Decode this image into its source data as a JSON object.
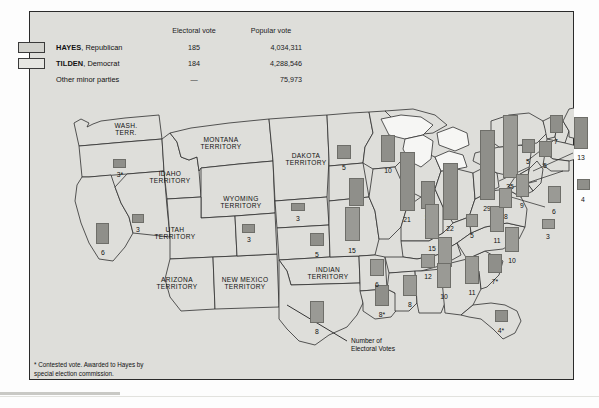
{
  "legend": {
    "col_electoral": "Electoral vote",
    "col_popular": "Popular vote",
    "rows": [
      {
        "candidate_bold": "HAYES",
        "candidate_rest": ", Republican",
        "electoral": "185",
        "popular": "4,034,311",
        "swatch": "hayes"
      },
      {
        "candidate_bold": "TILDEN",
        "candidate_rest": ", Democrat",
        "electoral": "184",
        "popular": "4,288,546",
        "swatch": "tilden"
      },
      {
        "candidate_bold": "",
        "candidate_rest": "Other minor parties",
        "electoral": "—",
        "popular": "75,973",
        "swatch": "none"
      }
    ]
  },
  "callout": {
    "line1": "Number of",
    "line2": "Electoral Votes"
  },
  "footnote": "* Contested vote. Awarded to Hayes by\n   special election commission.",
  "territories": [
    {
      "name": "WASH.\nTERR.",
      "x": 97,
      "y": 118
    },
    {
      "name": "MONTANA\nTERRITORY",
      "x": 192,
      "y": 132
    },
    {
      "name": "IDAHO\nTERRITORY",
      "x": 141,
      "y": 166
    },
    {
      "name": "WYOMING\nTERRITORY",
      "x": 212,
      "y": 191
    },
    {
      "name": "DAKOTA\nTERRITORY",
      "x": 277,
      "y": 148
    },
    {
      "name": "UTAH\nTERRITORY",
      "x": 146,
      "y": 222
    },
    {
      "name": "ARIZONA\nTERRITORY",
      "x": 148,
      "y": 272
    },
    {
      "name": "NEW MEXICO\nTERRITORY",
      "x": 216,
      "y": 272
    },
    {
      "name": "INDIAN\nTERRITORY",
      "x": 299,
      "y": 262
    }
  ],
  "states": [
    {
      "name": "Oregon",
      "votes": "3*",
      "party": "hayes",
      "bar": {
        "x": 84,
        "y": 148,
        "w": 13,
        "h": 9
      },
      "label": {
        "x": 91,
        "y": 160
      }
    },
    {
      "name": "California",
      "votes": "6",
      "party": "hayes",
      "bar": {
        "x": 67,
        "y": 212,
        "w": 13,
        "h": 21
      },
      "label": {
        "x": 74,
        "y": 238
      }
    },
    {
      "name": "Nevada",
      "votes": "3",
      "party": "hayes",
      "bar": {
        "x": 103,
        "y": 203,
        "w": 12,
        "h": 9
      },
      "label": {
        "x": 109,
        "y": 215
      }
    },
    {
      "name": "Colorado",
      "votes": "3",
      "party": "hayes",
      "bar": {
        "x": 213,
        "y": 213,
        "w": 13,
        "h": 9
      },
      "label": {
        "x": 220,
        "y": 225
      }
    },
    {
      "name": "Nebraska",
      "votes": "3",
      "party": "hayes",
      "bar": {
        "x": 262,
        "y": 192,
        "w": 14,
        "h": 8
      },
      "label": {
        "x": 269,
        "y": 204
      }
    },
    {
      "name": "Kansas",
      "votes": "5",
      "party": "hayes",
      "bar": {
        "x": 281,
        "y": 222,
        "w": 14,
        "h": 13
      },
      "label": {
        "x": 288,
        "y": 240
      }
    },
    {
      "name": "Minnesota",
      "votes": "5",
      "party": "hayes",
      "bar": {
        "x": 308,
        "y": 134,
        "w": 14,
        "h": 14
      },
      "label": {
        "x": 315,
        "y": 153
      }
    },
    {
      "name": "Iowa",
      "votes": "11",
      "party": "hayes",
      "bar": {
        "x": 320,
        "y": 167,
        "w": 15,
        "h": 28
      },
      "label": {
        "x": 327,
        "y": 200
      }
    },
    {
      "name": "Missouri",
      "votes": "15",
      "party": "tilden",
      "bar": {
        "x": 316,
        "y": 196,
        "w": 15,
        "h": 34
      },
      "label": {
        "x": 323,
        "y": 236
      }
    },
    {
      "name": "Wisconsin",
      "votes": "10",
      "party": "hayes",
      "bar": {
        "x": 352,
        "y": 124,
        "w": 14,
        "h": 27
      },
      "label": {
        "x": 359,
        "y": 156
      }
    },
    {
      "name": "Illinois",
      "votes": "21",
      "party": "hayes",
      "bar": {
        "x": 371,
        "y": 141,
        "w": 15,
        "h": 59
      },
      "label": {
        "x": 378,
        "y": 205
      }
    },
    {
      "name": "Michigan",
      "votes": "11",
      "party": "hayes",
      "bar": {
        "x": 392,
        "y": 170,
        "w": 14,
        "h": 28
      },
      "label": {
        "x": 399,
        "y": 203
      }
    },
    {
      "name": "Indiana",
      "votes": "15",
      "party": "tilden",
      "bar": {
        "x": 396,
        "y": 193,
        "w": 14,
        "h": 35
      },
      "label": {
        "x": 403,
        "y": 234
      }
    },
    {
      "name": "Ohio",
      "votes": "22",
      "party": "hayes",
      "bar": {
        "x": 414,
        "y": 152,
        "w": 15,
        "h": 57
      },
      "label": {
        "x": 421,
        "y": 214
      }
    },
    {
      "name": "Kentucky",
      "votes": "12",
      "party": "tilden",
      "bar": {
        "x": 409,
        "y": 226,
        "w": 14,
        "h": 30
      },
      "label": {
        "x": 416,
        "y": 261
      }
    },
    {
      "name": "Pennsylvania",
      "votes": "29",
      "party": "hayes",
      "bar": {
        "x": 451,
        "y": 119,
        "w": 15,
        "h": 70
      },
      "label": {
        "x": 458,
        "y": 194
      }
    },
    {
      "name": "West Virginia",
      "votes": "5",
      "party": "tilden",
      "bar": {
        "x": 437,
        "y": 203,
        "w": 12,
        "h": 13
      },
      "label": {
        "x": 443,
        "y": 221
      }
    },
    {
      "name": "Virginia",
      "votes": "11",
      "party": "tilden",
      "bar": {
        "x": 461,
        "y": 195,
        "w": 14,
        "h": 26
      },
      "label": {
        "x": 468,
        "y": 226
      }
    },
    {
      "name": "New York",
      "votes": "35",
      "party": "tilden",
      "bar": {
        "x": 474,
        "y": 104,
        "w": 15,
        "h": 63
      },
      "label": {
        "x": 481,
        "y": 172
      }
    },
    {
      "name": "Vermont",
      "votes": "5",
      "party": "hayes",
      "bar": {
        "x": 493,
        "y": 128,
        "w": 13,
        "h": 14
      },
      "label": {
        "x": 499,
        "y": 147
      }
    },
    {
      "name": "New Hampshire",
      "votes": "5",
      "party": "hayes",
      "bar": {
        "x": 510,
        "y": 130,
        "w": 13,
        "h": 16
      },
      "label": {
        "x": 516,
        "y": 151
      }
    },
    {
      "name": "Maine",
      "votes": "7",
      "party": "hayes",
      "bar": {
        "x": 521,
        "y": 104,
        "w": 13,
        "h": 18
      },
      "label": {
        "x": 527,
        "y": 127
      }
    },
    {
      "name": "Massachusetts",
      "votes": "13",
      "party": "hayes",
      "bar": {
        "x": 545,
        "y": 106,
        "w": 14,
        "h": 32
      },
      "label": {
        "x": 552,
        "y": 143
      }
    },
    {
      "name": "Rhode Island",
      "votes": "4",
      "party": "hayes",
      "bar": {
        "x": 548,
        "y": 168,
        "w": 13,
        "h": 11
      },
      "label": {
        "x": 554,
        "y": 185
      }
    },
    {
      "name": "Connecticut",
      "votes": "6",
      "party": "tilden",
      "bar": {
        "x": 519,
        "y": 175,
        "w": 13,
        "h": 17
      },
      "label": {
        "x": 525,
        "y": 197
      }
    },
    {
      "name": "New Jersey",
      "votes": "9",
      "party": "tilden",
      "bar": {
        "x": 487,
        "y": 163,
        "w": 13,
        "h": 23
      },
      "label": {
        "x": 493,
        "y": 191
      }
    },
    {
      "name": "Maryland",
      "votes": "8",
      "party": "tilden",
      "bar": {
        "x": 470,
        "y": 177,
        "w": 13,
        "h": 20
      },
      "label": {
        "x": 477,
        "y": 202
      }
    },
    {
      "name": "Delaware",
      "votes": "3",
      "party": "tilden",
      "bar": {
        "x": 513,
        "y": 208,
        "w": 13,
        "h": 10
      },
      "label": {
        "x": 519,
        "y": 222
      }
    },
    {
      "name": "North Carolina",
      "votes": "10",
      "party": "tilden",
      "bar": {
        "x": 476,
        "y": 216,
        "w": 14,
        "h": 25
      },
      "label": {
        "x": 483,
        "y": 246
      }
    },
    {
      "name": "South Carolina",
      "votes": "7*",
      "party": "hayes",
      "bar": {
        "x": 459,
        "y": 243,
        "w": 14,
        "h": 19
      },
      "label": {
        "x": 466,
        "y": 267
      }
    },
    {
      "name": "Georgia",
      "votes": "11",
      "party": "tilden",
      "bar": {
        "x": 436,
        "y": 245,
        "w": 14,
        "h": 28
      },
      "label": {
        "x": 443,
        "y": 278
      }
    },
    {
      "name": "Florida",
      "votes": "4*",
      "party": "hayes",
      "bar": {
        "x": 466,
        "y": 299,
        "w": 13,
        "h": 12
      },
      "label": {
        "x": 472,
        "y": 316
      }
    },
    {
      "name": "Alabama",
      "votes": "10",
      "party": "tilden",
      "bar": {
        "x": 408,
        "y": 252,
        "w": 14,
        "h": 25
      },
      "label": {
        "x": 415,
        "y": 282
      }
    },
    {
      "name": "Tennessee",
      "votes": "12",
      "party": "tilden",
      "bar": {
        "x": 392,
        "y": 243,
        "w": 14,
        "h": 14
      },
      "label": {
        "x": 399,
        "y": 262
      }
    },
    {
      "name": "Mississippi",
      "votes": "8",
      "party": "tilden",
      "bar": {
        "x": 374,
        "y": 264,
        "w": 14,
        "h": 21
      },
      "label": {
        "x": 381,
        "y": 290
      }
    },
    {
      "name": "Louisiana",
      "votes": "8*",
      "party": "hayes",
      "bar": {
        "x": 346,
        "y": 274,
        "w": 14,
        "h": 21
      },
      "label": {
        "x": 353,
        "y": 300
      }
    },
    {
      "name": "Arkansas",
      "votes": "6",
      "party": "tilden",
      "bar": {
        "x": 341,
        "y": 248,
        "w": 14,
        "h": 17
      },
      "label": {
        "x": 348,
        "y": 270
      }
    },
    {
      "name": "Texas",
      "votes": "8",
      "party": "tilden",
      "bar": {
        "x": 281,
        "y": 290,
        "w": 14,
        "h": 22
      },
      "label": {
        "x": 288,
        "y": 317
      }
    }
  ]
}
